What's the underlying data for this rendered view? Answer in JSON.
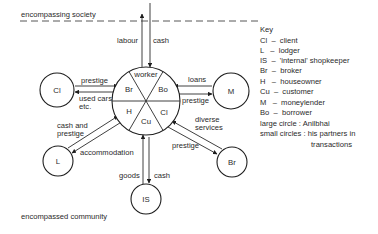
{
  "diagram": {
    "boundary_top_label": "encompassing society",
    "boundary_bottom_label": "encompassed community",
    "center": {
      "description": "Anilbhai",
      "segments": [
        "worker",
        "Bo",
        "Cl",
        "Cu",
        "H",
        "Br"
      ]
    },
    "nodes": {
      "cl": "Cl",
      "m": "M",
      "l": "L",
      "br": "Br",
      "is": "IS"
    },
    "flows": {
      "society_out": "labour",
      "society_in": "cash",
      "cl_to_center": "prestige",
      "center_to_cl_line1": "used cars",
      "center_to_cl_line2": "etc.",
      "m_to_center": "loans",
      "center_to_m": "prestige",
      "l_to_center_line1": "cash and",
      "l_to_center_line2": "prestige",
      "center_to_l": "accommodation",
      "br_to_center_line1": "diverse",
      "br_to_center_line2": "services",
      "center_to_br": "prestige",
      "is_to_center": "goods",
      "center_to_is": "cash"
    },
    "key": {
      "title": "Key",
      "entries": [
        "Cl  –  client",
        "L   –  lodger",
        "IS  –  'internal' shopkeeper",
        "Br  –  broker",
        "H   –  houseowner",
        "Cu  –  customer",
        "M   –  moneylender",
        "Bo  –  borrower",
        "large circle : Anilbhai",
        "small circles : his partners in",
        "transactions"
      ]
    }
  }
}
